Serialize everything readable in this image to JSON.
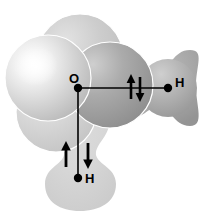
{
  "figure": {
    "background_color": "#ffffff"
  },
  "atoms": [
    {
      "id": "oxygen",
      "label": "O",
      "element": "O",
      "x": 78,
      "y": 88,
      "dot_color": "#000000"
    },
    {
      "id": "hydrogen-right",
      "label": "H",
      "element": "H",
      "x": 168,
      "y": 88,
      "dot_color": "#000000"
    },
    {
      "id": "hydrogen-bottom",
      "label": "H",
      "element": "H",
      "x": 78,
      "y": 178,
      "dot_color": "#000000"
    }
  ],
  "bonds": [
    {
      "id": "bond-o-h-right",
      "from": "oxygen",
      "to": "hydrogen-right",
      "orientation": "horizontal",
      "electron_spins": [
        "up",
        "down"
      ],
      "spin_label": "up-down",
      "color": "#000000"
    },
    {
      "id": "bond-o-h-bottom",
      "from": "oxygen",
      "to": "hydrogen-bottom",
      "orientation": "vertical",
      "electron_spins": [
        "up",
        "down"
      ],
      "spin_label": "up-down",
      "color": "#000000"
    }
  ],
  "orbitals": [
    {
      "id": "lobe-upper-left",
      "name": "sp3-lone-pair-upper-left",
      "shape": "circle",
      "fill_light": "#fcfcfc",
      "fill_dark": "#b4b4b4",
      "outline": "#ffffff"
    },
    {
      "id": "lobe-upper-right",
      "name": "sp3-lone-pair-upper-right",
      "shape": "circle",
      "fill_light": "#c9c9c9",
      "fill_dark": "#8d8d8d",
      "outline": "#ffffff"
    },
    {
      "id": "lobe-top",
      "name": "sp3-hybrid-top",
      "shape": "circle",
      "fill_light": "#dcdcdc",
      "fill_dark": "#bdbdbd",
      "outline": "#ffffff"
    },
    {
      "id": "lobe-lower-left",
      "name": "sp3-hybrid-lower-left",
      "shape": "circle",
      "fill_light": "#e4e4e4",
      "fill_dark": "#c2c2c2",
      "outline": "#ffffff"
    },
    {
      "id": "bonding-orbital-right",
      "name": "sigma-bonding-orbital-o-h-right",
      "shape": "dumbbell",
      "fill_light": "#c4c4c4",
      "fill_dark": "#9a9a9a",
      "outline": "none"
    },
    {
      "id": "bonding-orbital-bottom",
      "name": "sigma-bonding-orbital-o-h-bottom",
      "shape": "dumbbell",
      "fill_light": "#dadada",
      "fill_dark": "#d2d2d2",
      "outline": "none"
    }
  ],
  "spin_arrows": [
    {
      "id": "spin-up-right-bond",
      "direction": "up",
      "bond": "bond-o-h-right",
      "x": 131,
      "y": 88
    },
    {
      "id": "spin-down-right-bond",
      "direction": "down",
      "bond": "bond-o-h-right",
      "x": 140,
      "y": 88
    },
    {
      "id": "spin-up-bottom-bond",
      "direction": "up",
      "bond": "bond-o-h-bottom",
      "x": 66,
      "y": 155
    },
    {
      "id": "spin-down-bottom-bond",
      "direction": "down",
      "bond": "bond-o-h-bottom",
      "x": 87,
      "y": 155
    }
  ]
}
